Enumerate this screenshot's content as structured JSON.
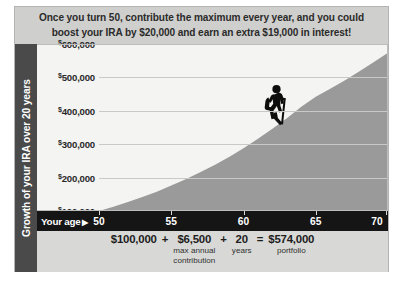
{
  "headline": {
    "line1": "Once you turn 50, contribute the maximum every year, and you could",
    "line2": "boost your IRA by $20,000 and earn an extra $19,000 in interest!"
  },
  "y_axis": {
    "title": "Growth of your IRA over 20 years",
    "ticks": [
      "600,000",
      "500,000",
      "400,000",
      "300,000",
      "200,000",
      "100,000"
    ],
    "currency_symbol": "$"
  },
  "x_axis": {
    "title": "Your age",
    "arrow": "▶",
    "ticks": [
      "50",
      "55",
      "60",
      "65",
      "70"
    ]
  },
  "formula": {
    "principal": "$100,000",
    "op1": "+",
    "annual": "$6,500",
    "annual_sub_line1": "max annual",
    "annual_sub_line2": "contribution",
    "op2": "+",
    "years": "20",
    "years_sub": "years",
    "equals": "=",
    "total": "$574,000",
    "total_sub": "portfolio"
  },
  "colors": {
    "card_bg": "#d8d8d6",
    "header_bg": "#cfcfcd",
    "axis_bar": "#151515",
    "y_title_bar": "#4a4a4a",
    "area_fill": "#9a9a9a",
    "plot_bg": "#f4f4f2",
    "grid": "#c9c9c7"
  },
  "chart_data": {
    "type": "area",
    "title": "Growth of your IRA over 20 years",
    "xlabel": "Your age",
    "ylabel": "Growth of your IRA over 20 years",
    "xlim": [
      50,
      70
    ],
    "ylim": [
      100000,
      600000
    ],
    "grid": true,
    "legend": "none",
    "x_tick_values": [
      50,
      55,
      60,
      65,
      70
    ],
    "y_tick_values": [
      100000,
      200000,
      300000,
      400000,
      500000,
      600000
    ],
    "x": [
      50,
      51,
      52,
      53,
      54,
      55,
      56,
      57,
      58,
      59,
      60,
      61,
      62,
      63,
      64,
      65,
      66,
      67,
      68,
      69,
      70
    ],
    "values": [
      100000,
      113000,
      127000,
      142000,
      158000,
      176000,
      195000,
      216000,
      238000,
      262000,
      288000,
      316000,
      346000,
      378000,
      412000,
      442000,
      466000,
      491000,
      518000,
      545000,
      574000
    ],
    "annotations": [
      {
        "label": "hiker-climbing-curve",
        "x": 63,
        "y": 400000
      }
    ]
  }
}
